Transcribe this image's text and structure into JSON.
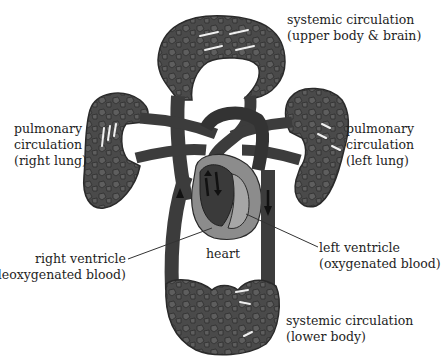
{
  "diagram": {
    "labels": {
      "systemic_upper": {
        "line1": "systemic circulation",
        "line2": "(upper body & brain)"
      },
      "pulmonary_right": {
        "line1": "pulmonary",
        "line2": "circulation",
        "line3": "(right lung)"
      },
      "pulmonary_left": {
        "line1": "pulmonary",
        "line2": "circulation",
        "line3": "(left lung)"
      },
      "right_ventricle": {
        "line1": "right ventricle",
        "line2": "(deoxygenated blood)"
      },
      "heart": {
        "line1": "heart"
      },
      "left_ventricle": {
        "line1": "left ventricle",
        "line2": "(oxygenated blood)"
      },
      "systemic_lower": {
        "line1": "systemic circulation",
        "line2": "(lower body)"
      }
    },
    "colors": {
      "vessel": "#3c3c3c",
      "vessel_dark": "#262626",
      "capillary_fill": "#595959",
      "heart_wall": "#8c8c8c",
      "heart_light": "#a6a6a6",
      "text": "#1e1e1e",
      "background": "#ffffff"
    }
  }
}
